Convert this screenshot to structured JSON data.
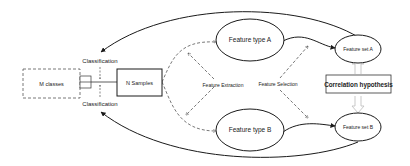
{
  "diagram": {
    "nodes": {
      "m_classes": {
        "label": "M classes",
        "style": "dashed-rect"
      },
      "n_samples": {
        "label": "N Samples",
        "style": "solid-rect"
      },
      "feature_type_a": {
        "label": "Feature type A",
        "style": "ellipse"
      },
      "feature_type_b": {
        "label": "Feature type B",
        "style": "ellipse"
      },
      "feature_set_a": {
        "label": "Feature set A",
        "style": "ellipse"
      },
      "feature_set_b": {
        "label": "Feature set B",
        "style": "ellipse"
      },
      "correlation": {
        "label": "Correlation hypothesis",
        "style": "bold-rect"
      }
    },
    "edge_labels": {
      "classification_top": "Classification",
      "classification_bottom": "Classification",
      "feature_extraction": "Feature Extraction",
      "feature_selection": "Feature Selection"
    },
    "edges": [
      {
        "from": "feature_set_a",
        "to": "classification_top",
        "style": "solid-curve"
      },
      {
        "from": "feature_set_b",
        "to": "classification_bottom",
        "style": "solid-curve"
      },
      {
        "from": "n_samples",
        "to": "feature_type_a",
        "style": "dashed-curve"
      },
      {
        "from": "n_samples",
        "to": "feature_type_b",
        "style": "dashed-curve"
      },
      {
        "from": "feature_type_a",
        "to": "feature_set_a",
        "style": "solid-curve"
      },
      {
        "from": "feature_type_b",
        "to": "feature_set_b",
        "style": "solid-curve"
      },
      {
        "from": "correlation",
        "to": "feature_set_a",
        "style": "hollow-double-arrow"
      },
      {
        "from": "correlation",
        "to": "feature_set_b",
        "style": "hollow-double-arrow"
      },
      {
        "from": "m_classes",
        "to": "n_samples",
        "style": "connector"
      }
    ],
    "colors": {
      "stroke": "#1a1a1a",
      "dashed": "#555555",
      "hollow_arrow": "#bbbbbb",
      "text": "#222222"
    }
  }
}
